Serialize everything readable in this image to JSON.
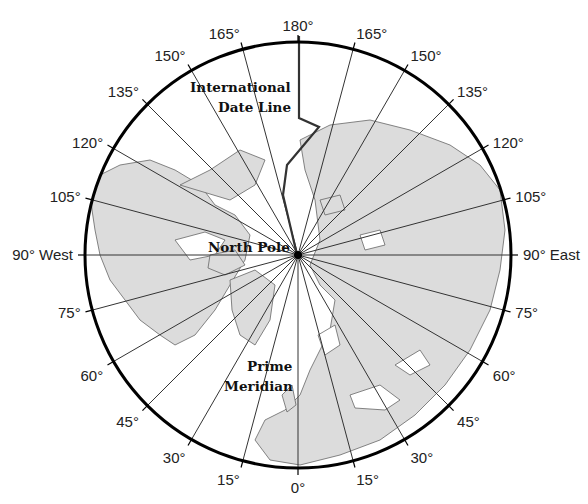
{
  "map": {
    "title_labels": {
      "date_line": [
        "International",
        "Date Line"
      ],
      "north_pole": "North Pole",
      "prime_meridian": [
        "Prime",
        "Meridian"
      ]
    },
    "center": {
      "x": 298,
      "y": 255
    },
    "radius": 213,
    "meridian_step_deg": 15,
    "colors": {
      "land": "#dcdcdc",
      "ocean": "#ffffff",
      "lines": "#333333",
      "border": "#000000"
    },
    "longitude_labels": [
      {
        "deg": 0,
        "text": "0°"
      },
      {
        "deg": 15,
        "text": "15°"
      },
      {
        "deg": 30,
        "text": "30°"
      },
      {
        "deg": 45,
        "text": "45°"
      },
      {
        "deg": 60,
        "text": "60°"
      },
      {
        "deg": 75,
        "text": "75°"
      },
      {
        "deg": 90,
        "text": "90° East"
      },
      {
        "deg": 105,
        "text": "105°"
      },
      {
        "deg": 120,
        "text": "120°"
      },
      {
        "deg": 135,
        "text": "135°"
      },
      {
        "deg": 150,
        "text": "150°"
      },
      {
        "deg": 165,
        "text": "165°"
      },
      {
        "deg": 180,
        "text": "180°"
      },
      {
        "deg": -165,
        "text": "165°"
      },
      {
        "deg": -150,
        "text": "150°"
      },
      {
        "deg": -135,
        "text": "135°"
      },
      {
        "deg": -120,
        "text": "120°"
      },
      {
        "deg": -105,
        "text": "105°"
      },
      {
        "deg": -90,
        "text": "90° West"
      },
      {
        "deg": -75,
        "text": "75°"
      },
      {
        "deg": -60,
        "text": "60°"
      },
      {
        "deg": -45,
        "text": "45°"
      },
      {
        "deg": -30,
        "text": "30°"
      },
      {
        "deg": -15,
        "text": "15°"
      }
    ]
  }
}
